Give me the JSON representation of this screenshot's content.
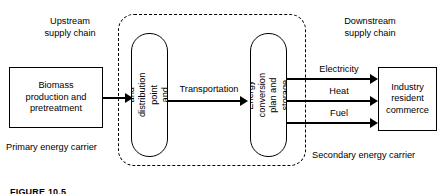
{
  "figure": {
    "caption": "FIGURE 10.5"
  },
  "regions": {
    "upstream_label": "Upstream\nsupply chain",
    "downstream_label": "Downstream\nsupply chain",
    "primary_carrier_label": "Primary energy carrier",
    "secondary_carrier_label": "Secondary energy carrier"
  },
  "nodes": {
    "biomass": "Biomass\nproduction and\npretreatment",
    "collection": "Collection and\ndistribution point\nand storage",
    "conversion": "Energy\nconversion plan and\nstorage",
    "consumer": "Industry\nresident\ncommerce"
  },
  "flows": {
    "biomass_to_collection": "",
    "transportation": "Transportation",
    "electricity": "Electricity",
    "heat": "Heat",
    "fuel": "Fuel"
  },
  "colors": {
    "stroke": "#000000",
    "background": "#ffffff"
  }
}
